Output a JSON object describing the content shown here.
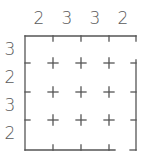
{
  "puzzle": {
    "size": 4,
    "column_clues": [
      "2",
      "3",
      "3",
      "2"
    ],
    "row_clues": [
      "3",
      "2",
      "3",
      "2"
    ],
    "line_color": "#555555",
    "text_color": "#5a5a5a",
    "background": "#ffffff"
  }
}
